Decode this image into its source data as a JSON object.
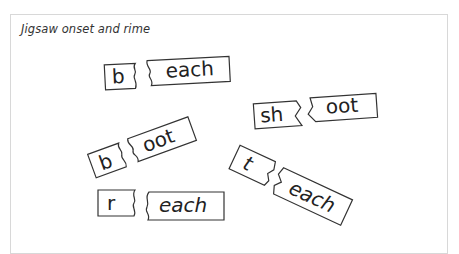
{
  "title": "Jigsaw onset and rime",
  "pairs": [
    {
      "onset": "b",
      "rime": "each",
      "tilt_deg": -3
    },
    {
      "onset": "sh",
      "rime": "oot",
      "tilt_deg": -4
    },
    {
      "onset": "b",
      "rime": "oot",
      "tilt_deg": -20
    },
    {
      "onset": "r",
      "rime": "each",
      "tilt_deg": 0
    },
    {
      "onset": "t",
      "rime": "each",
      "tilt_deg": 25
    }
  ],
  "colors": {
    "outline": "#333333",
    "text": "#222222",
    "frame": "#d8d8d8"
  }
}
